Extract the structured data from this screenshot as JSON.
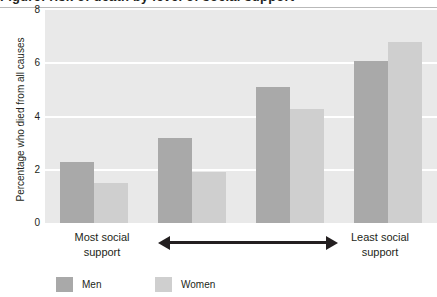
{
  "title_partial": "Figure: risk of death by level of social support",
  "chart_data": {
    "type": "bar",
    "title": "",
    "xlabel": "",
    "ylabel": "Percentage who died from all causes",
    "categories": [
      "1",
      "2",
      "3",
      "4"
    ],
    "series": [
      {
        "name": "Men",
        "color": "#a9a9a9",
        "values": [
          2.3,
          3.2,
          5.1,
          6.1
        ]
      },
      {
        "name": "Women",
        "color": "#cfcfcf",
        "values": [
          1.5,
          1.9,
          4.3,
          6.8
        ]
      }
    ],
    "ylim": [
      0,
      8
    ],
    "yticks": [
      "0",
      "2",
      "4",
      "6",
      "8"
    ],
    "ytick_values": [
      0,
      2,
      4,
      6,
      8
    ],
    "grid": "horizontal-white",
    "legend_position": "bottom-left",
    "plot_background": "#e9e9e9",
    "annotations": {
      "left_label": "Most social\nsupport",
      "right_label": "Least social\nsupport",
      "arrow": "double-headed-horizontal"
    }
  },
  "axis": {
    "left_label_line1": "Most social",
    "left_label_line2": "support",
    "right_label_line1": "Least social",
    "right_label_line2": "support"
  },
  "legend": {
    "men_label": "Men",
    "women_label": "Women"
  }
}
